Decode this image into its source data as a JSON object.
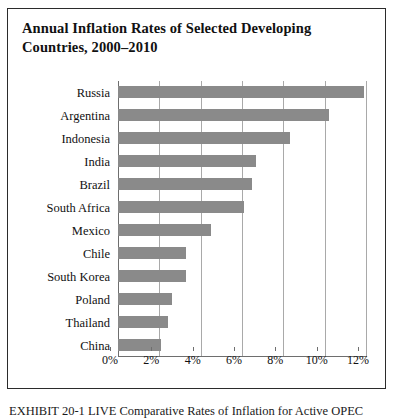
{
  "figure": {
    "title": "Annual Inflation Rates of Selected Developing Countries, 2000–2010",
    "caption": "EXHIBIT 20-1 LIVE Comparative Rates of Inflation for Active OPEC"
  },
  "chart_data": {
    "type": "bar",
    "orientation": "horizontal",
    "title": "Annual Inflation Rates of Selected Developing Countries, 2000–2010",
    "xlabel": "",
    "ylabel": "",
    "categories": [
      "Russia",
      "Argentina",
      "Indonesia",
      "India",
      "Brazil",
      "South Africa",
      "Mexico",
      "Chile",
      "South Korea",
      "Poland",
      "Thailand",
      "China"
    ],
    "values": [
      11.9,
      10.2,
      8.3,
      6.7,
      6.5,
      6.1,
      4.5,
      3.3,
      3.3,
      2.6,
      2.4,
      2.1
    ],
    "value_unit": "percent",
    "xlim": [
      0,
      12
    ],
    "xticks": [
      0,
      2,
      4,
      6,
      8,
      10,
      12
    ],
    "xtick_labels": [
      "0%",
      "2%",
      "4%",
      "6%",
      "8%",
      "10%",
      "12%"
    ],
    "grid": "vertical",
    "legend": "none",
    "bar_color": "#8a8a8a",
    "grid_color": "#a9a9a9",
    "axis_color": "#6e6e6e"
  }
}
